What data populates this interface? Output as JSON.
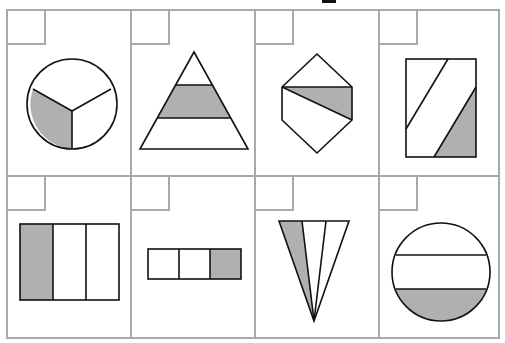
{
  "worksheet": {
    "title": "Fraction shading worksheet",
    "colors": {
      "grid_line": "#a9a9a9",
      "shade": "#b0b0b0",
      "stroke": "#111111",
      "background": "#ffffff"
    },
    "cells": [
      {
        "index": 0,
        "shape": "circle",
        "parts": 3,
        "shaded": 1,
        "answer": ""
      },
      {
        "index": 1,
        "shape": "triangle",
        "parts": 3,
        "shaded": 1,
        "answer": ""
      },
      {
        "index": 2,
        "shape": "hexagon",
        "parts": 4,
        "shaded": 1,
        "answer": ""
      },
      {
        "index": 3,
        "shape": "rectangle",
        "parts": 3,
        "shaded": 1,
        "answer": ""
      },
      {
        "index": 4,
        "shape": "square",
        "parts": 3,
        "shaded": 1,
        "answer": ""
      },
      {
        "index": 5,
        "shape": "bar",
        "parts": 3,
        "shaded": 1,
        "answer": ""
      },
      {
        "index": 6,
        "shape": "cone",
        "parts": 3,
        "shaded": 1,
        "answer": ""
      },
      {
        "index": 7,
        "shape": "circle-strips",
        "parts": 3,
        "shaded": 1,
        "answer": ""
      }
    ]
  }
}
